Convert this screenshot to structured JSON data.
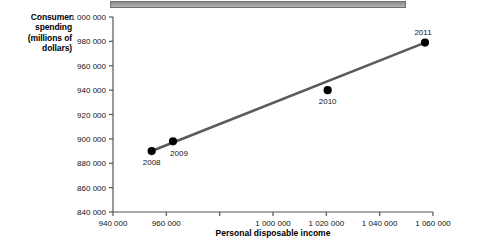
{
  "chart_data": {
    "type": "scatter",
    "title": "",
    "xlabel": "Personal disposable income",
    "ylabel": "Consumer spending (millions of dollars)",
    "ylabel_lines": [
      "Consumer",
      "spending",
      "(millions of",
      "dollars)"
    ],
    "xlim": [
      940000,
      1060000
    ],
    "ylim": [
      840000,
      1000000
    ],
    "xticks": [
      940000,
      960000,
      980000,
      1000000,
      1020000,
      1040000,
      1060000
    ],
    "xticklabels": [
      "940 000",
      "960 000",
      "980 000",
      "1 000 000",
      "1 020 000",
      "1 040 000",
      "1 060 000"
    ],
    "xticklabels_visible": [
      "940 000",
      "960 000",
      "",
      "1 000 000",
      "1 020 000",
      "1 040 000",
      "1 060 000"
    ],
    "yticks": [
      840000,
      860000,
      880000,
      900000,
      920000,
      940000,
      960000,
      980000,
      1000000
    ],
    "yticklabels": [
      "840 000",
      "860 000",
      "880 000",
      "900 000",
      "920 000",
      "940 000",
      "960 000",
      "980 000",
      "1 000 000"
    ],
    "grid": false,
    "legend": false,
    "points": [
      {
        "label": "2008",
        "x": 954500,
        "y": 890000
      },
      {
        "label": "2009",
        "x": 962500,
        "y": 898000
      },
      {
        "label": "2010",
        "x": 1020500,
        "y": 940000
      },
      {
        "label": "2011",
        "x": 1057000,
        "y": 979000
      }
    ],
    "trendline": {
      "name": "trend",
      "x": [
        954500,
        1057000
      ],
      "y": [
        890000,
        979000
      ]
    },
    "colors": {
      "marker": "#000000",
      "trendline": "#5a5a5a",
      "axis": "#555555",
      "text": "#111111",
      "topbar": "#9b9b9b"
    }
  }
}
